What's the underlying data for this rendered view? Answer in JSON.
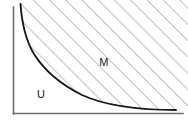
{
  "figure": {
    "kind": "math-region-diagram",
    "width": 188,
    "height": 127,
    "background_color": "#ffffff"
  },
  "axes": {
    "y_axis": {
      "name": "vertical-axis",
      "x": 13.5,
      "y_top": 7,
      "y_bottom": 114,
      "color": "#6e6e6e",
      "stroke_width": 1.6
    },
    "x_axis": {
      "name": "horizontal-axis",
      "y": 113.5,
      "x_left": 13.5,
      "x_right": 183,
      "color": "#6e6e6e",
      "stroke_width": 1.6
    }
  },
  "curve": {
    "name": "boundary-curve",
    "description": "hyperbola-like decreasing convex boundary separating U from M",
    "color": "#1a1a1a",
    "stroke_width": 1.9,
    "path": "M 20.5 4 C 21.8 22 25.5 40 34 54 C 44 70 60 84 82 95 C 106 106 140 110 176 110"
  },
  "hatching": {
    "name": "diagonal-hatch-fill",
    "angle_degrees": 45,
    "direction": "up-to-the-right",
    "spacing_px": 11.5,
    "color": "#8a8a8a",
    "stroke_width": 1.1
  },
  "labels": [
    {
      "name": "region-label-m",
      "text": "M",
      "x": 104,
      "y": 66,
      "region": "hatched-upper-right"
    },
    {
      "name": "region-label-u",
      "text": "U",
      "x": 41,
      "y": 98,
      "region": "unhatched-lower-left"
    }
  ],
  "colors": {
    "curve": "#1a1a1a",
    "axis": "#6e6e6e",
    "hatch": "#8a8a8a",
    "text": "#1a1a1a",
    "background": "#ffffff"
  }
}
